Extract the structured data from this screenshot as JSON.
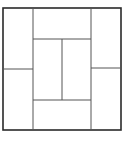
{
  "diagram": {
    "type": "rectangle-partition",
    "canvas": {
      "width": 130,
      "height": 142,
      "background": "#ffffff"
    },
    "outer_square": {
      "x": 3,
      "y": 8,
      "width": 118,
      "height": 122,
      "stroke": "#2a2a2a",
      "stroke_width": 1.6
    },
    "inner_lines": [
      {
        "name": "left-vertical",
        "x1": 33,
        "y1": 8,
        "x2": 33,
        "y2": 130
      },
      {
        "name": "right-vertical",
        "x1": 91,
        "y1": 8,
        "x2": 91,
        "y2": 130
      },
      {
        "name": "left-horizontal",
        "x1": 3,
        "y1": 69,
        "x2": 33,
        "y2": 69
      },
      {
        "name": "right-horizontal",
        "x1": 91,
        "y1": 68,
        "x2": 121,
        "y2": 68
      },
      {
        "name": "top-horizontal",
        "x1": 33,
        "y1": 39,
        "x2": 91,
        "y2": 39
      },
      {
        "name": "bottom-horizontal",
        "x1": 33,
        "y1": 100,
        "x2": 91,
        "y2": 100
      },
      {
        "name": "center-vertical",
        "x1": 62,
        "y1": 39,
        "x2": 62,
        "y2": 100
      }
    ],
    "inner_stroke": "#555555",
    "inner_stroke_width": 1,
    "rectangle_count": 8
  }
}
